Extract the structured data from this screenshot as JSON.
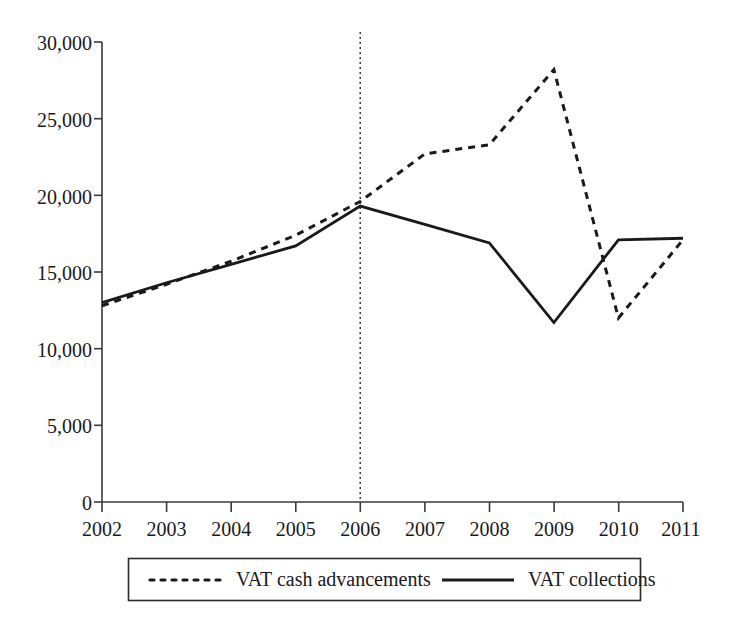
{
  "chart_data": {
    "type": "line",
    "title": "",
    "subtitle": "",
    "xlabel": "",
    "ylabel": "",
    "categories": [
      "2002",
      "2003",
      "2004",
      "2005",
      "2006",
      "2007",
      "2008",
      "2009",
      "2010",
      "2011"
    ],
    "x": [
      2002,
      2003,
      2004,
      2005,
      2006,
      2007,
      2008,
      2009,
      2010,
      2011
    ],
    "xlim": [
      2002,
      2011
    ],
    "ylim": [
      0,
      30000
    ],
    "ytick_values": [
      0,
      5000,
      10000,
      15000,
      20000,
      25000,
      30000
    ],
    "ytick_labels": [
      "0",
      "5,000",
      "10,000",
      "15,000",
      "20,000",
      "25,000",
      "30,000"
    ],
    "xtick_labels": [
      "2002",
      "2003",
      "2004",
      "2005",
      "2006",
      "2007",
      "2008",
      "2009",
      "2010",
      "2011"
    ],
    "grid": false,
    "legend_position": "bottom",
    "series": [
      {
        "name": "VAT cash advancements",
        "style": "dashed",
        "color": "#1a1a1a",
        "values": [
          12800,
          14200,
          15700,
          17400,
          19600,
          22700,
          23300,
          28200,
          12000,
          17100
        ]
      },
      {
        "name": "VAT collections",
        "style": "solid",
        "color": "#1a1a1a",
        "values": [
          13000,
          14300,
          15500,
          16700,
          19300,
          18100,
          16900,
          11700,
          17100,
          17200
        ]
      }
    ],
    "annotations": [
      {
        "type": "vertical-reference-line",
        "x": 2006,
        "style": "dotted",
        "color": "#2b2b2b",
        "label": ""
      }
    ]
  },
  "legend": {
    "entries": [
      {
        "label": "VAT cash advancements",
        "marker": "dashed-line-swatch"
      },
      {
        "label": "VAT collections",
        "marker": "solid-line-swatch"
      }
    ]
  },
  "axes": {
    "y": {
      "labels": [
        "30,000",
        "25,000",
        "20,000",
        "15,000",
        "10,000",
        "5,000",
        "0"
      ]
    },
    "x": {
      "labels": [
        "2002",
        "2003",
        "2004",
        "2005",
        "2006",
        "2007",
        "2008",
        "2009",
        "2010",
        "2011"
      ]
    }
  }
}
